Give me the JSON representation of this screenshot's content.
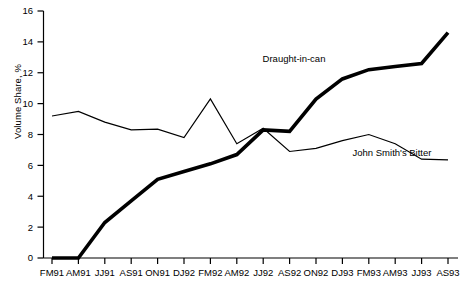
{
  "chart_data": {
    "type": "line",
    "title": "",
    "xlabel": "",
    "ylabel": "Volume Share, %",
    "ylim": [
      0,
      16
    ],
    "yticks": [
      0,
      2,
      4,
      6,
      8,
      10,
      12,
      14,
      16
    ],
    "grid": false,
    "legend_position": "inline-annotation",
    "categories": [
      "FM91",
      "AM91",
      "JJ91",
      "AS91",
      "ON91",
      "DJ92",
      "FM92",
      "AM92",
      "JJ92",
      "AS92",
      "ON92",
      "DJ93",
      "FM93",
      "AM93",
      "JJ93",
      "AS93"
    ],
    "x": [
      "FM91",
      "AM91",
      "JJ91",
      "AS91",
      "ON91",
      "DJ92",
      "FM92",
      "AM92",
      "JJ92",
      "AS92",
      "ON92",
      "DJ93",
      "FM93",
      "AM93",
      "JJ93",
      "AS93"
    ],
    "series": [
      {
        "name": "Draught-in-can",
        "style": "thick",
        "values": [
          0.0,
          0.0,
          2.3,
          3.7,
          5.1,
          5.6,
          6.1,
          6.7,
          8.3,
          8.2,
          10.3,
          11.6,
          12.2,
          12.4,
          12.6,
          14.6
        ]
      },
      {
        "name": "John Smith's Bitter",
        "style": "thin",
        "values": [
          9.2,
          9.5,
          8.8,
          8.3,
          8.35,
          7.8,
          10.3,
          7.4,
          8.4,
          6.9,
          7.1,
          7.6,
          8.0,
          7.4,
          6.4,
          6.35
        ]
      }
    ],
    "annotations": [
      {
        "text": "Draught-in-can",
        "x_px": 294,
        "y_px": 62
      },
      {
        "text": "John Smith's Bitter",
        "x_px": 392,
        "y_px": 156
      }
    ]
  },
  "axis": {
    "y_tick_labels": [
      "16",
      "14",
      "12",
      "10",
      "8",
      "6",
      "4",
      "2",
      "0"
    ],
    "x_tick_labels": [
      "FM91",
      "AM91",
      "JJ91",
      "AS91",
      "ON91",
      "DJ92",
      "FM92",
      "AM92",
      "JJ92",
      "AS92",
      "ON92",
      "DJ93",
      "FM93",
      "AM93",
      "JJ93",
      "AS93"
    ],
    "y_axis_title": "Volume Share, %"
  },
  "colors": {
    "axis": "#000000",
    "thick_series": "#000000",
    "thin_series": "#000000",
    "background": "#ffffff"
  }
}
